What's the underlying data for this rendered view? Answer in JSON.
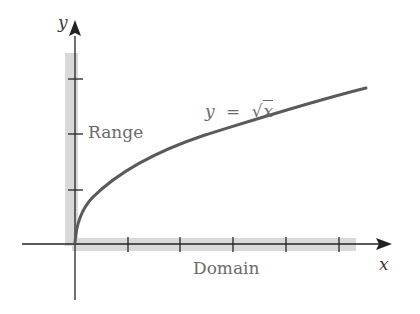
{
  "figure": {
    "x_axis_label": "x",
    "y_axis_label": "y",
    "equation_label": {
      "lhs": "y",
      "eq": "=",
      "radical": "√",
      "radicand": "x"
    },
    "range_label": "Range",
    "domain_label": "Domain",
    "x_ticks_count": 5,
    "y_ticks_count": 3,
    "colors": {
      "axis": "#222222",
      "curve": "#5a5a5a",
      "shading": "#d9d9d9",
      "label_text": "#6b6b6b"
    }
  }
}
